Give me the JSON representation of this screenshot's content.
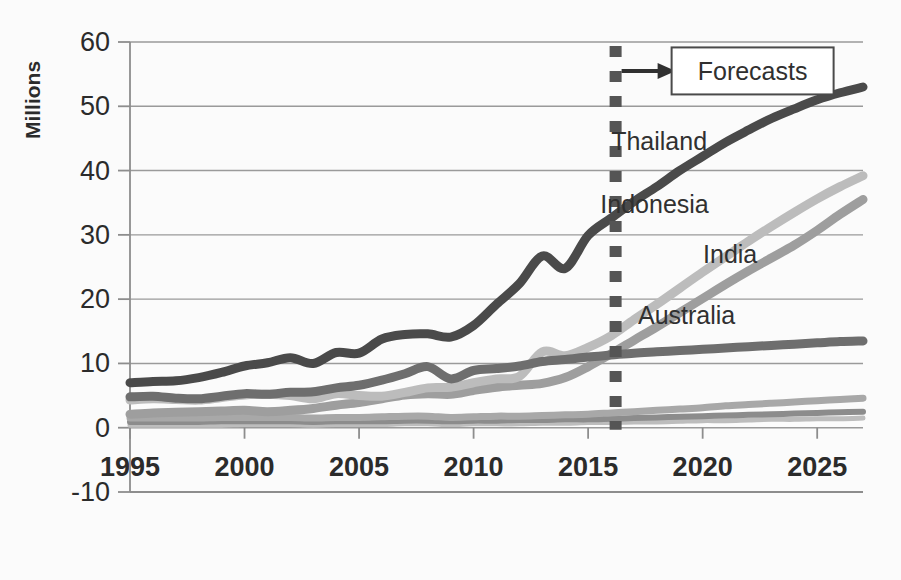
{
  "chart_data": {
    "type": "line",
    "title": "",
    "subtitle": "",
    "xlabel": "",
    "ylabel": "Millions",
    "xlim": [
      1995,
      2027
    ],
    "ylim": [
      -10,
      60
    ],
    "ytick_labels": [
      "60",
      "50",
      "40",
      "30",
      "20",
      "10",
      "0",
      "-10"
    ],
    "ytick_values": [
      60,
      50,
      40,
      30,
      20,
      10,
      0,
      -10
    ],
    "xtick_labels": [
      "1995",
      "2000",
      "2005",
      "2010",
      "2015",
      "2020",
      "2025"
    ],
    "xtick_values": [
      1995,
      2000,
      2005,
      2010,
      2015,
      2020,
      2025
    ],
    "grid": "horizontal",
    "legend_position": "inline-right-labels",
    "annotations": [
      {
        "name": "forecast-divider",
        "type": "vertical-dashed-line",
        "x": 2016.2,
        "label": ""
      },
      {
        "name": "forecast-callout",
        "type": "boxed-text-with-arrow",
        "label": "Forecasts",
        "x": 2016.2,
        "y": 55.5
      }
    ],
    "x": [
      1995,
      1996,
      1997,
      1998,
      1999,
      2000,
      2001,
      2002,
      2003,
      2004,
      2005,
      2006,
      2007,
      2008,
      2009,
      2010,
      2011,
      2012,
      2013,
      2014,
      2015,
      2016,
      2017,
      2018,
      2019,
      2020,
      2021,
      2022,
      2023,
      2024,
      2025,
      2026,
      2027
    ],
    "series": [
      {
        "name": "Thailand",
        "label": "Thailand",
        "color": "#4a4a4a",
        "width": 9,
        "label_x": 2018.1,
        "label_y": 44.6,
        "values": [
          7.0,
          7.2,
          7.3,
          7.8,
          8.6,
          9.6,
          10.1,
          10.9,
          10.0,
          11.7,
          11.6,
          13.8,
          14.5,
          14.6,
          14.1,
          15.9,
          19.2,
          22.4,
          26.7,
          24.8,
          29.9,
          32.6,
          35.2,
          37.5,
          40.0,
          42.2,
          44.4,
          46.3,
          48.1,
          49.6,
          51.0,
          52.1,
          53.0
        ]
      },
      {
        "name": "Indonesia",
        "label": "Indonesia",
        "color": "#bcbcbc",
        "width": 9,
        "label_x": 2017.9,
        "label_y": 34.8,
        "values": [
          4.3,
          4.5,
          4.4,
          4.3,
          4.7,
          5.1,
          5.2,
          5.0,
          4.5,
          5.3,
          5.0,
          4.9,
          5.5,
          6.2,
          6.3,
          7.0,
          7.6,
          8.0,
          11.8,
          11.2,
          12.5,
          14.3,
          16.8,
          19.2,
          21.7,
          24.2,
          26.6,
          29.0,
          31.3,
          33.5,
          35.6,
          37.5,
          39.2
        ]
      },
      {
        "name": "India",
        "label": "India",
        "color": "#9e9e9e",
        "width": 9,
        "label_x": 2021.2,
        "label_y": 27.0,
        "values": [
          2.1,
          2.3,
          2.4,
          2.5,
          2.6,
          2.7,
          2.5,
          2.7,
          3.0,
          3.5,
          3.9,
          4.5,
          5.1,
          5.3,
          5.2,
          5.8,
          6.3,
          6.6,
          6.9,
          7.8,
          9.5,
          11.5,
          13.6,
          15.7,
          17.9,
          20.1,
          22.3,
          24.4,
          26.4,
          28.4,
          30.7,
          33.2,
          35.5
        ]
      },
      {
        "name": "Australia",
        "label": "Australia",
        "color": "#6e6e6e",
        "width": 9,
        "label_x": 2019.3,
        "label_y": 17.5,
        "values": [
          4.8,
          4.9,
          4.6,
          4.5,
          4.9,
          5.3,
          5.2,
          5.5,
          5.6,
          6.2,
          6.6,
          7.4,
          8.4,
          9.5,
          7.6,
          8.9,
          9.2,
          9.6,
          10.3,
          10.6,
          11.0,
          11.3,
          11.6,
          11.8,
          12.0,
          12.2,
          12.4,
          12.6,
          12.8,
          13.0,
          13.2,
          13.4,
          13.5
        ]
      },
      {
        "name": "Other-1",
        "label": "",
        "color": "#a8a8a8",
        "width": 7,
        "label_x": null,
        "label_y": null,
        "values": [
          1.5,
          1.5,
          1.5,
          1.5,
          1.6,
          1.6,
          1.6,
          1.6,
          1.5,
          1.6,
          1.6,
          1.7,
          1.8,
          1.8,
          1.6,
          1.7,
          1.8,
          1.8,
          1.9,
          2.0,
          2.1,
          2.3,
          2.5,
          2.7,
          2.9,
          3.1,
          3.4,
          3.6,
          3.8,
          4.0,
          4.2,
          4.4,
          4.6
        ]
      },
      {
        "name": "Other-2",
        "label": "",
        "color": "#8c8c8c",
        "width": 6,
        "label_x": null,
        "label_y": null,
        "values": [
          0.9,
          0.9,
          0.9,
          0.9,
          1.0,
          1.0,
          1.0,
          1.0,
          0.9,
          1.0,
          1.0,
          1.0,
          1.1,
          1.1,
          1.0,
          1.1,
          1.1,
          1.2,
          1.2,
          1.3,
          1.3,
          1.4,
          1.5,
          1.6,
          1.7,
          1.8,
          1.9,
          2.0,
          2.1,
          2.2,
          2.3,
          2.4,
          2.5
        ]
      },
      {
        "name": "Other-3",
        "label": "",
        "color": "#bdbdbd",
        "width": 5,
        "label_x": null,
        "label_y": null,
        "values": [
          0.4,
          0.4,
          0.4,
          0.4,
          0.4,
          0.5,
          0.5,
          0.5,
          0.4,
          0.5,
          0.5,
          0.5,
          0.6,
          0.6,
          0.5,
          0.6,
          0.6,
          0.6,
          0.7,
          0.7,
          0.8,
          0.8,
          0.9,
          0.9,
          1.0,
          1.1,
          1.1,
          1.2,
          1.3,
          1.3,
          1.4,
          1.4,
          1.5
        ]
      }
    ]
  },
  "colors": {
    "grid": "#9a9a9a",
    "axis": "#8d8d8d",
    "text": "#2b2b2b",
    "forecast_line": "#555555",
    "background": "#fbfbfb"
  }
}
